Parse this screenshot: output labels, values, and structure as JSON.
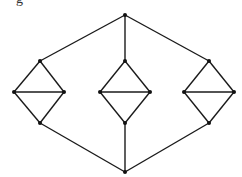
{
  "fragment_text": "g",
  "graph": {
    "edge_color": "#1a1a1a",
    "node_color": "#111111",
    "nodes": [
      {
        "id": "top",
        "x": 125,
        "y": 15
      },
      {
        "id": "bottom",
        "x": 125,
        "y": 172
      },
      {
        "id": "L_top",
        "x": 40,
        "y": 61
      },
      {
        "id": "L_left",
        "x": 14,
        "y": 92
      },
      {
        "id": "L_right",
        "x": 64,
        "y": 92
      },
      {
        "id": "L_bottom",
        "x": 40,
        "y": 123
      },
      {
        "id": "M_top",
        "x": 125,
        "y": 61
      },
      {
        "id": "M_left",
        "x": 100,
        "y": 92
      },
      {
        "id": "M_right",
        "x": 150,
        "y": 92
      },
      {
        "id": "M_bottom",
        "x": 125,
        "y": 123
      },
      {
        "id": "R_top",
        "x": 209,
        "y": 61
      },
      {
        "id": "R_left",
        "x": 184,
        "y": 92
      },
      {
        "id": "R_right",
        "x": 234,
        "y": 92
      },
      {
        "id": "R_bottom",
        "x": 209,
        "y": 123
      }
    ],
    "edges": [
      [
        "top",
        "L_top"
      ],
      [
        "top",
        "M_top"
      ],
      [
        "top",
        "R_top"
      ],
      [
        "bottom",
        "L_bottom"
      ],
      [
        "bottom",
        "M_bottom"
      ],
      [
        "bottom",
        "R_bottom"
      ],
      [
        "L_top",
        "L_left"
      ],
      [
        "L_top",
        "L_right"
      ],
      [
        "L_left",
        "L_right"
      ],
      [
        "L_left",
        "L_bottom"
      ],
      [
        "L_right",
        "L_bottom"
      ],
      [
        "M_top",
        "M_left"
      ],
      [
        "M_top",
        "M_right"
      ],
      [
        "M_left",
        "M_right"
      ],
      [
        "M_left",
        "M_bottom"
      ],
      [
        "M_right",
        "M_bottom"
      ],
      [
        "R_top",
        "R_left"
      ],
      [
        "R_top",
        "R_right"
      ],
      [
        "R_left",
        "R_right"
      ],
      [
        "R_left",
        "R_bottom"
      ],
      [
        "R_right",
        "R_bottom"
      ]
    ]
  }
}
